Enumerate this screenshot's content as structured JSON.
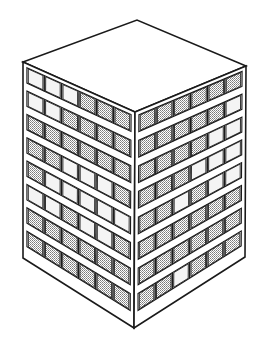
{
  "image": {
    "subject": "isometric line drawing of a cubic office building",
    "width": 263,
    "height": 343,
    "background": "#ffffff",
    "line_color": "#1a1a1a",
    "hatch_color": "#8a8a8a",
    "light_window_color": "#f4f4f4"
  },
  "building": {
    "floors": 8,
    "columns_per_face": 6,
    "top_face": [
      [
        23,
        62
      ],
      [
        137,
        20
      ],
      [
        246,
        66
      ],
      [
        135,
        112
      ]
    ],
    "left_face": {
      "tl": [
        23,
        62
      ],
      "tr": [
        135,
        112
      ],
      "br": [
        134,
        328
      ],
      "bl": [
        23,
        258
      ]
    },
    "right_face": {
      "tl": [
        135,
        112
      ],
      "tr": [
        246,
        66
      ],
      "br": [
        245,
        257
      ],
      "bl": [
        134,
        328
      ]
    },
    "left_shading": [
      [
        0,
        0,
        0,
        1,
        1,
        1
      ],
      [
        0,
        0,
        1,
        1,
        1,
        1
      ],
      [
        1,
        1,
        1,
        1,
        1,
        1
      ],
      [
        1,
        1,
        0,
        0,
        0,
        1
      ],
      [
        1,
        0,
        0,
        0,
        0,
        0
      ],
      [
        0,
        0,
        1,
        0,
        0,
        1
      ],
      [
        1,
        1,
        1,
        1,
        1,
        1
      ],
      [
        1,
        1,
        1,
        1,
        1,
        1
      ]
    ],
    "right_shading": [
      [
        1,
        1,
        1,
        1,
        1,
        1
      ],
      [
        1,
        1,
        1,
        1,
        1,
        0
      ],
      [
        1,
        1,
        1,
        1,
        0,
        0
      ],
      [
        1,
        1,
        1,
        0,
        0,
        0
      ],
      [
        1,
        1,
        0,
        1,
        0,
        0
      ],
      [
        1,
        1,
        1,
        1,
        1,
        1
      ],
      [
        1,
        1,
        1,
        1,
        1,
        1
      ],
      [
        1,
        1,
        0,
        1,
        1,
        1
      ]
    ]
  }
}
